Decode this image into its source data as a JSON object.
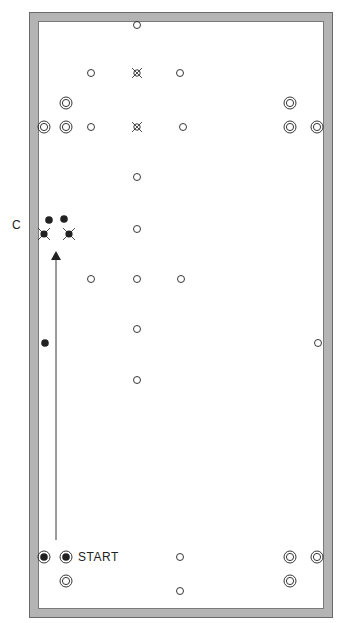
{
  "diagram": {
    "labels": {
      "c_marker": "C",
      "start": "START"
    },
    "colors": {
      "rail": "#b4b4b4",
      "rail_edge": "#6a6a6a",
      "ink": "#222222",
      "felt": "#ffffff"
    },
    "open_spots": [
      {
        "x": 137,
        "y": 25
      },
      {
        "x": 91,
        "y": 73
      },
      {
        "x": 180,
        "y": 73
      },
      {
        "x": 91,
        "y": 127
      },
      {
        "x": 183,
        "y": 127
      },
      {
        "x": 137,
        "y": 177
      },
      {
        "x": 137,
        "y": 229
      },
      {
        "x": 91,
        "y": 279
      },
      {
        "x": 137,
        "y": 279
      },
      {
        "x": 181,
        "y": 279
      },
      {
        "x": 137,
        "y": 329
      },
      {
        "x": 137,
        "y": 380
      },
      {
        "x": 318,
        "y": 343
      },
      {
        "x": 180,
        "y": 557
      },
      {
        "x": 180,
        "y": 591
      }
    ],
    "cross_spots": [
      {
        "x": 137,
        "y": 73
      },
      {
        "x": 137,
        "y": 127
      }
    ],
    "double_rings": [
      {
        "x": 66,
        "y": 103
      },
      {
        "x": 44,
        "y": 127
      },
      {
        "x": 66,
        "y": 127
      },
      {
        "x": 290,
        "y": 103
      },
      {
        "x": 290,
        "y": 127
      },
      {
        "x": 317,
        "y": 127
      },
      {
        "x": 66,
        "y": 581
      },
      {
        "x": 290,
        "y": 557
      },
      {
        "x": 317,
        "y": 557
      },
      {
        "x": 290,
        "y": 581
      }
    ],
    "filled_rings": [
      {
        "x": 44,
        "y": 557
      },
      {
        "x": 66,
        "y": 557
      }
    ],
    "solid_dots": [
      {
        "x": 49,
        "y": 220
      },
      {
        "x": 64,
        "y": 219
      },
      {
        "x": 45,
        "y": 343
      }
    ],
    "crossed_dots": [
      {
        "x": 44,
        "y": 234
      },
      {
        "x": 69,
        "y": 234
      }
    ],
    "arrow": {
      "x": 56,
      "y1": 540,
      "y2": 250,
      "head_y": 251
    }
  }
}
